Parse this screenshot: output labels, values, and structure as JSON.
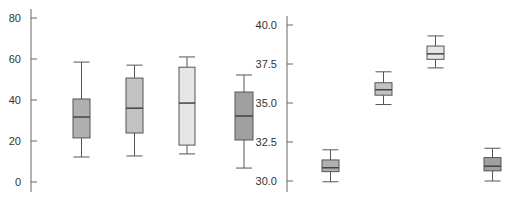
{
  "chart_data": [
    {
      "type": "boxplot",
      "title": "",
      "xlabel": "",
      "ylabel": "",
      "ylim": [
        -4,
        85
      ],
      "yticks": [
        0,
        20,
        40,
        60,
        80
      ],
      "ytick_labels": [
        "0",
        "20",
        "40",
        "60",
        "80"
      ],
      "grid": false,
      "legend": null,
      "boxes": [
        {
          "whisker_low": 12.2,
          "q1": 21.5,
          "median": 31.7,
          "q3": 40.5,
          "whisker_high": 58.5,
          "color": "#b0b0b0"
        },
        {
          "whisker_low": 12.7,
          "q1": 23.9,
          "median": 36.0,
          "q3": 50.7,
          "whisker_high": 57.0,
          "color": "#c2c2c2"
        },
        {
          "whisker_low": 13.7,
          "q1": 18.0,
          "median": 38.5,
          "q3": 56.0,
          "whisker_high": 61.0,
          "color": "#e6e6e6"
        },
        {
          "whisker_low": 6.8,
          "q1": 20.5,
          "median": 32.2,
          "q3": 43.9,
          "whisker_high": 52.2,
          "color": "#a0a0a0"
        }
      ]
    },
    {
      "type": "boxplot",
      "title": "",
      "xlabel": "",
      "ylabel": "",
      "ylim": [
        29.5,
        40.6
      ],
      "yticks": [
        30.0,
        32.5,
        35.0,
        37.5,
        40.0
      ],
      "ytick_labels": [
        "30.0",
        "32.5",
        "35.0",
        "37.5",
        "40.0"
      ],
      "grid": false,
      "legend": null,
      "boxes": [
        {
          "whisker_low": 29.95,
          "q1": 30.6,
          "median": 30.85,
          "q3": 31.35,
          "whisker_high": 32.0,
          "color": "#b0b0b0"
        },
        {
          "whisker_low": 34.9,
          "q1": 35.5,
          "median": 35.85,
          "q3": 36.3,
          "whisker_high": 37.0,
          "color": "#c2c2c2"
        },
        {
          "whisker_low": 37.25,
          "q1": 37.8,
          "median": 38.15,
          "q3": 38.65,
          "whisker_high": 39.3,
          "color": "#e6e6e6"
        },
        {
          "whisker_low": 30.0,
          "q1": 30.65,
          "median": 30.95,
          "q3": 31.5,
          "whisker_high": 32.1,
          "color": "#a0a0a0"
        }
      ]
    }
  ]
}
